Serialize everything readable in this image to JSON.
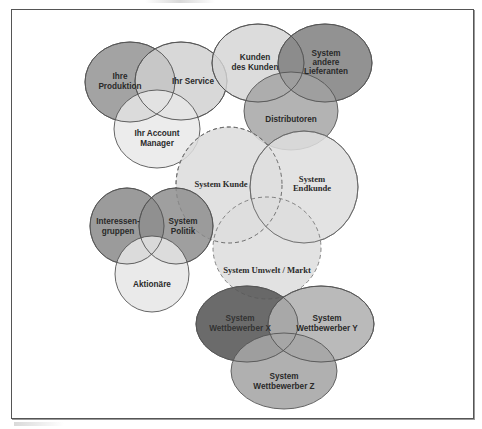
{
  "diagram": {
    "type": "venn-cluster",
    "frame": {
      "border_color": "#555555",
      "background": "#ffffff"
    },
    "groups": [
      {
        "id": "intern",
        "circles": [
          {
            "label_lines": [
              "Ihre",
              "Produktion"
            ],
            "cx": 130,
            "cy": 82,
            "rx": 45,
            "ry": 40,
            "fill": "#8f8f8f",
            "stroke": "solid"
          },
          {
            "label_lines": [
              "Ihr Service"
            ],
            "cx": 181,
            "cy": 81,
            "rx": 46,
            "ry": 39,
            "fill": "#cfcfcf",
            "stroke": "solid"
          },
          {
            "label_lines": [
              "Ihr Account",
              "Manager"
            ],
            "cx": 157,
            "cy": 129,
            "rx": 43,
            "ry": 39,
            "fill": "#e8e8e8",
            "stroke": "solid"
          }
        ]
      },
      {
        "id": "markt-oben",
        "circles": [
          {
            "label_lines": [
              "Kunden",
              "des Kunden"
            ],
            "cx": 258,
            "cy": 63,
            "rx": 46,
            "ry": 39,
            "fill": "#d4d4d4",
            "stroke": "solid"
          },
          {
            "label_lines": [
              "System",
              "andere",
              "Lieferanten"
            ],
            "cx": 325,
            "cy": 63,
            "rx": 47,
            "ry": 39,
            "fill": "#7a7a7a",
            "stroke": "solid"
          },
          {
            "label_lines": [
              "Distributoren"
            ],
            "cx": 291,
            "cy": 111,
            "rx": 47,
            "ry": 39,
            "fill": "#a2a2a2",
            "stroke": "solid"
          }
        ]
      },
      {
        "id": "zentrum",
        "circles": [
          {
            "label_lines": [
              "System Kunde"
            ],
            "cx": 229,
            "cy": 185,
            "rx": 53,
            "ry": 58,
            "fill": "#dcdcdc",
            "stroke": "dashed"
          },
          {
            "label_lines": [
              "System",
              "Endkunde"
            ],
            "cx": 304,
            "cy": 187,
            "rx": 54,
            "ry": 56,
            "fill": "#dedede",
            "stroke": "solid"
          },
          {
            "label_lines": [
              "System Umwelt / Markt"
            ],
            "cx": 267,
            "cy": 248,
            "rx": 54,
            "ry": 51,
            "fill": "#dddddd",
            "stroke": "dashed"
          }
        ]
      },
      {
        "id": "umfeld",
        "circles": [
          {
            "label_lines": [
              "Interessen-",
              "gruppen"
            ],
            "cx": 127,
            "cy": 226,
            "rx": 37,
            "ry": 38,
            "fill": "#8a8a8a",
            "stroke": "solid"
          },
          {
            "label_lines": [
              "System",
              "Politik"
            ],
            "cx": 176,
            "cy": 226,
            "rx": 37,
            "ry": 38,
            "fill": "#8e8e8e",
            "stroke": "solid"
          },
          {
            "label_lines": [
              "Aktionäre"
            ],
            "cx": 152,
            "cy": 274,
            "rx": 37,
            "ry": 38,
            "fill": "#e6e6e6",
            "stroke": "solid"
          }
        ]
      },
      {
        "id": "wettbewerb",
        "circles": [
          {
            "label_lines": [
              "System",
              "Wettbewerber X"
            ],
            "cx": 247,
            "cy": 324,
            "rx": 51,
            "ry": 38,
            "fill": "#575757",
            "stroke": "solid"
          },
          {
            "label_lines": [
              "System",
              "Wettbewerber Y"
            ],
            "cx": 321,
            "cy": 324,
            "rx": 53,
            "ry": 38,
            "fill": "#b0b0b0",
            "stroke": "solid"
          },
          {
            "label_lines": [
              "System",
              "Wettbewerber Z"
            ],
            "cx": 284,
            "cy": 371,
            "rx": 53,
            "ry": 38,
            "fill": "#a5a5a5",
            "stroke": "solid"
          }
        ]
      }
    ]
  },
  "labels": {
    "ihre_produktion_1": "Ihre",
    "ihre_produktion_2": "Produktion",
    "ihr_service": "Ihr Service",
    "account_manager_1": "Ihr Account",
    "account_manager_2": "Manager",
    "kunden_des_kunden_1": "Kunden",
    "kunden_des_kunden_2": "des Kunden",
    "lieferanten_1": "System",
    "lieferanten_2": "andere",
    "lieferanten_3": "Lieferanten",
    "distributoren": "Distributoren",
    "system_kunde": "System Kunde",
    "endkunde_1": "System",
    "endkunde_2": "Endkunde",
    "umwelt_markt": "System Umwelt / Markt",
    "interessengruppen_1": "Interessen-",
    "interessengruppen_2": "gruppen",
    "politik_1": "System",
    "politik_2": "Politik",
    "aktionaere": "Aktionäre",
    "wettbewerber_x_1": "System",
    "wettbewerber_x_2": "Wettbewerber X",
    "wettbewerber_y_1": "System",
    "wettbewerber_y_2": "Wettbewerber Y",
    "wettbewerber_z_1": "System",
    "wettbewerber_z_2": "Wettbewerber Z"
  }
}
